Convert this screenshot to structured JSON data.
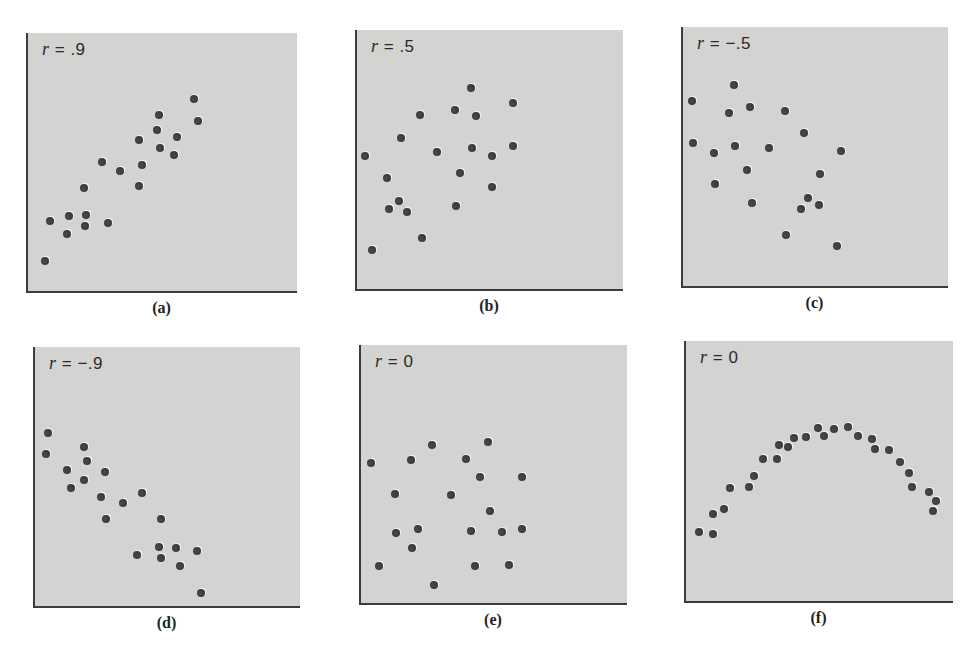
{
  "chart_data": [
    {
      "type": "scatter",
      "id": "a",
      "caption": "(a)",
      "r_symbol": "r",
      "r_value": "= .9",
      "title": "r = .9",
      "xlabel": "",
      "ylabel": "",
      "grid": false,
      "panel": {
        "left": 26,
        "top": 33,
        "width": 271,
        "height": 260
      },
      "points": [
        [
          17,
          228
        ],
        [
          22,
          188
        ],
        [
          41,
          183
        ],
        [
          39,
          201
        ],
        [
          58,
          182
        ],
        [
          57,
          193
        ],
        [
          80,
          190
        ],
        [
          56,
          155
        ],
        [
          74,
          129
        ],
        [
          92,
          138
        ],
        [
          111,
          153
        ],
        [
          114,
          132
        ],
        [
          111,
          107
        ],
        [
          129,
          97
        ],
        [
          131,
          82
        ],
        [
          132,
          115
        ],
        [
          146,
          122
        ],
        [
          149,
          104
        ],
        [
          166,
          66
        ],
        [
          170,
          88
        ]
      ]
    },
    {
      "type": "scatter",
      "id": "b",
      "caption": "(b)",
      "r_symbol": "r",
      "r_value": "= .5",
      "title": "r = .5",
      "xlabel": "",
      "ylabel": "",
      "grid": false,
      "panel": {
        "left": 355,
        "top": 30,
        "width": 268,
        "height": 261
      },
      "points": [
        [
          8,
          126
        ],
        [
          15,
          220
        ],
        [
          30,
          148
        ],
        [
          32,
          179
        ],
        [
          42,
          171
        ],
        [
          50,
          182
        ],
        [
          44,
          108
        ],
        [
          63,
          85
        ],
        [
          65,
          208
        ],
        [
          80,
          122
        ],
        [
          98,
          80
        ],
        [
          99,
          176
        ],
        [
          103,
          143
        ],
        [
          114,
          58
        ],
        [
          115,
          118
        ],
        [
          119,
          86
        ],
        [
          135,
          126
        ],
        [
          135,
          157
        ],
        [
          156,
          73
        ],
        [
          156,
          116
        ]
      ]
    },
    {
      "type": "scatter",
      "id": "c",
      "caption": "(c)",
      "r_symbol": "r",
      "r_value": "= −.5",
      "title": "r = -.5",
      "xlabel": "",
      "ylabel": "",
      "grid": false,
      "panel": {
        "left": 681,
        "top": 27,
        "width": 267,
        "height": 261
      },
      "points": [
        [
          9,
          74
        ],
        [
          10,
          116
        ],
        [
          31,
          126
        ],
        [
          32,
          157
        ],
        [
          46,
          86
        ],
        [
          51,
          58
        ],
        [
          52,
          119
        ],
        [
          64,
          143
        ],
        [
          67,
          80
        ],
        [
          69,
          176
        ],
        [
          86,
          121
        ],
        [
          102,
          84
        ],
        [
          103,
          208
        ],
        [
          118,
          182
        ],
        [
          121,
          106
        ],
        [
          125,
          171
        ],
        [
          136,
          178
        ],
        [
          137,
          147
        ],
        [
          154,
          219
        ],
        [
          158,
          124
        ]
      ]
    },
    {
      "type": "scatter",
      "id": "d",
      "caption": "(d)",
      "r_symbol": "r",
      "r_value": "= −.9",
      "title": "r = -.9",
      "xlabel": "",
      "ylabel": "",
      "grid": false,
      "panel": {
        "left": 33,
        "top": 347,
        "width": 267,
        "height": 261
      },
      "points": [
        [
          13,
          86
        ],
        [
          11,
          107
        ],
        [
          49,
          100
        ],
        [
          52,
          114
        ],
        [
          32,
          123
        ],
        [
          70,
          125
        ],
        [
          49,
          133
        ],
        [
          36,
          141
        ],
        [
          66,
          150
        ],
        [
          88,
          156
        ],
        [
          107,
          146
        ],
        [
          71,
          172
        ],
        [
          126,
          172
        ],
        [
          124,
          200
        ],
        [
          141,
          201
        ],
        [
          162,
          204
        ],
        [
          102,
          208
        ],
        [
          126,
          211
        ],
        [
          145,
          219
        ],
        [
          166,
          246
        ]
      ]
    },
    {
      "type": "scatter",
      "id": "e",
      "caption": "(e)",
      "r_symbol": "r",
      "r_value": "= 0",
      "title": "r = 0",
      "xlabel": "",
      "ylabel": "",
      "grid": false,
      "panel": {
        "left": 359,
        "top": 345,
        "width": 268,
        "height": 260
      },
      "points": [
        [
          10,
          118
        ],
        [
          18,
          221
        ],
        [
          34,
          149
        ],
        [
          35,
          188
        ],
        [
          50,
          115
        ],
        [
          51,
          203
        ],
        [
          57,
          184
        ],
        [
          71,
          100
        ],
        [
          73,
          240
        ],
        [
          90,
          150
        ],
        [
          105,
          114
        ],
        [
          110,
          186
        ],
        [
          114,
          221
        ],
        [
          119,
          132
        ],
        [
          127,
          97
        ],
        [
          129,
          166
        ],
        [
          141,
          187
        ],
        [
          148,
          220
        ],
        [
          161,
          132
        ],
        [
          161,
          184
        ]
      ]
    },
    {
      "type": "scatter",
      "id": "f",
      "caption": "(f)",
      "r_symbol": "r",
      "r_value": "= 0",
      "title": "r = 0",
      "xlabel": "",
      "ylabel": "",
      "grid": false,
      "panel": {
        "left": 684,
        "top": 341,
        "width": 269,
        "height": 262
      },
      "points": [
        [
          13,
          191
        ],
        [
          27,
          193
        ],
        [
          27,
          173
        ],
        [
          38,
          168
        ],
        [
          44,
          147
        ],
        [
          63,
          146
        ],
        [
          68,
          135
        ],
        [
          77,
          118
        ],
        [
          91,
          118
        ],
        [
          93,
          104
        ],
        [
          102,
          106
        ],
        [
          108,
          97
        ],
        [
          120,
          96
        ],
        [
          132,
          87
        ],
        [
          138,
          95
        ],
        [
          148,
          88
        ],
        [
          162,
          86
        ],
        [
          172,
          95
        ],
        [
          186,
          98
        ],
        [
          189,
          108
        ],
        [
          203,
          109
        ],
        [
          214,
          121
        ],
        [
          223,
          132
        ],
        [
          226,
          146
        ],
        [
          243,
          151
        ],
        [
          250,
          160
        ],
        [
          247,
          170
        ]
      ]
    }
  ],
  "colors": {
    "panel_bg": "#d3d3d2",
    "axis": "#3c3c3c",
    "dot": "#3a3a3a",
    "text": "#222222"
  }
}
